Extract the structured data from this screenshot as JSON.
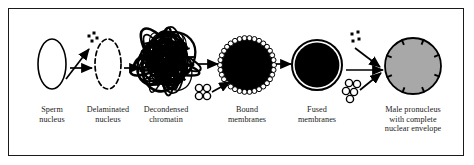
{
  "figure": {
    "background_color": "#ffffff",
    "border_color": "#1a1a1a",
    "ink_color": "#000000",
    "label_color": "#222222",
    "pronucleus_fill": "#a8a8a8"
  },
  "stages": [
    {
      "id": "sperm-nucleus",
      "label": "Sperm\nnucleus",
      "shape": "ellipse-outline",
      "fill": "none",
      "stroke": "#000000",
      "cx": 52,
      "cy": 64,
      "rx": 14,
      "ry": 25,
      "label_x": 52,
      "label_y": 105
    },
    {
      "id": "delaminated-nucleus",
      "label": "Delaminated\nnucleus",
      "shape": "ellipse-dashed",
      "fill": "none",
      "stroke": "#000000",
      "cx": 108,
      "cy": 64,
      "rx": 13,
      "ry": 25,
      "label_x": 108,
      "label_y": 105
    },
    {
      "id": "decondensed-chromatin",
      "label": "Decondensed\nchromatin",
      "shape": "tangle",
      "fill": "none",
      "stroke": "#000000",
      "cx": 166,
      "cy": 62,
      "rx": 31,
      "ry": 27,
      "label_x": 166,
      "label_y": 105
    },
    {
      "id": "bound-membranes",
      "label": "Bound\nmembranes",
      "shape": "disc-beaded",
      "fill": "#000000",
      "stroke": "#000000",
      "cx": 247,
      "cy": 65,
      "rx": 27,
      "ry": 27,
      "label_x": 247,
      "label_y": 105
    },
    {
      "id": "fused-membranes",
      "label": "Fused\nmembranes",
      "shape": "disc-ringed",
      "fill": "#000000",
      "stroke": "#000000",
      "cx": 317,
      "cy": 65,
      "rx": 25,
      "ry": 25,
      "label_x": 317,
      "label_y": 105
    },
    {
      "id": "male-pronucleus",
      "label": "Male pronucleus\nwith complete\nnuclear envelope",
      "shape": "disc-pored",
      "fill": "#a8a8a8",
      "stroke": "#000000",
      "cx": 413,
      "cy": 66,
      "rx": 28,
      "ry": 28,
      "label_x": 413,
      "label_y": 105
    }
  ],
  "arrows": [
    {
      "id": "arrow-sperm-to-delaminated",
      "x1": 70,
      "y1": 68,
      "x2": 92,
      "y2": 68
    },
    {
      "id": "arrow-delaminated-to-chromatin",
      "x1": 124,
      "y1": 68,
      "x2": 140,
      "y2": 68
    },
    {
      "id": "arrow-chromatin-to-bound",
      "x1": 198,
      "y1": 64,
      "x2": 218,
      "y2": 64
    },
    {
      "id": "arrow-bound-to-fused",
      "x1": 276,
      "y1": 64,
      "x2": 291,
      "y2": 64
    },
    {
      "id": "arrow-fused-to-pronucleus",
      "x1": 346,
      "y1": 70,
      "x2": 383,
      "y2": 70
    },
    {
      "id": "arrow-dots-to-delaminated",
      "x1": 66,
      "y1": 79,
      "x2": 89,
      "y2": 49
    },
    {
      "id": "arrow-vesicles-to-bound",
      "x1": 212,
      "y1": 92,
      "x2": 230,
      "y2": 82
    },
    {
      "id": "arrow-dots-to-pronucleus",
      "x1": 355,
      "y1": 48,
      "x2": 380,
      "y2": 67
    },
    {
      "id": "arrow-vesicles-to-pronucleus",
      "x1": 360,
      "y1": 90,
      "x2": 381,
      "y2": 73
    }
  ],
  "clusters": [
    {
      "id": "dot-cluster-delaminated",
      "type": "dots",
      "count": 4,
      "points": [
        [
          89,
          36
        ],
        [
          94,
          33
        ],
        [
          92,
          41
        ],
        [
          97,
          38
        ]
      ]
    },
    {
      "id": "vesicle-cluster-bound",
      "type": "vesicles",
      "count": 4,
      "points": [
        [
          199,
          88
        ],
        [
          207,
          88
        ],
        [
          199,
          96
        ],
        [
          207,
          96
        ]
      ],
      "radius": 3.6
    },
    {
      "id": "dot-cluster-pronucleus",
      "type": "dots",
      "count": 4,
      "points": [
        [
          352,
          34
        ],
        [
          358,
          32
        ],
        [
          353,
          41
        ],
        [
          359,
          39
        ]
      ]
    },
    {
      "id": "vesicle-cluster-pronucleus",
      "type": "vesicles",
      "count": 5,
      "points": [
        [
          349,
          83
        ],
        [
          357,
          84
        ],
        [
          346,
          91
        ],
        [
          354,
          92
        ],
        [
          350,
          99
        ]
      ],
      "radius": 3.6
    }
  ]
}
